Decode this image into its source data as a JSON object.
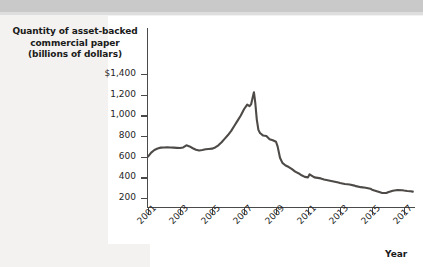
{
  "figure": {
    "y_axis_title_lines": [
      "Quantity of asset-backed",
      "commercial paper",
      "(billions of dollars)"
    ],
    "x_axis_title": "Year",
    "line_color": "#4d4a47",
    "background_color": "#f3f2f0",
    "canvas_color": "#ffffff",
    "axis_color": "#4a4a4a"
  },
  "chart_data": {
    "type": "line",
    "title": "",
    "xlabel": "Year",
    "ylabel": "Quantity of asset-backed commercial paper (billions of dollars)",
    "xlim": [
      2001,
      2017.6
    ],
    "ylim": [
      0,
      1400
    ],
    "grid": false,
    "legend": null,
    "ytick_labels": [
      "$1,400",
      "1,200",
      "1,000",
      "800",
      "600",
      "400",
      "200"
    ],
    "ytick_values": [
      1400,
      1200,
      1000,
      800,
      600,
      400,
      200
    ],
    "xtick_labels": [
      "2001",
      "2003",
      "2005",
      "2007",
      "2009",
      "2011",
      "2013",
      "2015",
      "2017"
    ],
    "xtick_values": [
      2001,
      2003,
      2005,
      2007,
      2009,
      2011,
      2013,
      2015,
      2017
    ],
    "series": [
      {
        "name": "Asset-backed commercial paper outstanding",
        "x": [
          2001.0,
          2001.2,
          2001.4,
          2001.6,
          2001.8,
          2002.0,
          2002.2,
          2002.4,
          2002.6,
          2002.8,
          2003.0,
          2003.2,
          2003.4,
          2003.6,
          2003.8,
          2004.0,
          2004.2,
          2004.4,
          2004.6,
          2004.8,
          2005.0,
          2005.2,
          2005.4,
          2005.6,
          2005.8,
          2006.0,
          2006.2,
          2006.4,
          2006.6,
          2006.8,
          2007.0,
          2007.2,
          2007.35,
          2007.45,
          2007.55,
          2007.62,
          2007.7,
          2007.8,
          2007.9,
          2008.0,
          2008.2,
          2008.4,
          2008.6,
          2008.8,
          2009.0,
          2009.1,
          2009.25,
          2009.4,
          2009.6,
          2009.8,
          2010.0,
          2010.2,
          2010.4,
          2010.6,
          2010.8,
          2011.0,
          2011.1,
          2011.25,
          2011.4,
          2011.6,
          2011.8,
          2012.0,
          2012.3,
          2012.6,
          2012.9,
          2013.0,
          2013.3,
          2013.6,
          2013.9,
          2014.0,
          2014.3,
          2014.6,
          2014.9,
          2015.0,
          2015.3,
          2015.6,
          2015.9,
          2016.0,
          2016.3,
          2016.6,
          2016.9,
          2017.0,
          2017.2,
          2017.4,
          2017.55
        ],
        "y": [
          600,
          640,
          665,
          680,
          688,
          690,
          692,
          690,
          688,
          686,
          684,
          690,
          710,
          700,
          682,
          668,
          660,
          665,
          672,
          675,
          678,
          690,
          710,
          740,
          775,
          810,
          850,
          900,
          950,
          1000,
          1060,
          1105,
          1090,
          1110,
          1180,
          1225,
          1130,
          960,
          860,
          830,
          805,
          800,
          770,
          760,
          745,
          700,
          590,
          540,
          515,
          500,
          480,
          455,
          440,
          420,
          405,
          400,
          430,
          415,
          400,
          395,
          390,
          380,
          370,
          360,
          350,
          345,
          335,
          330,
          320,
          315,
          305,
          300,
          290,
          280,
          265,
          250,
          248,
          255,
          270,
          278,
          275,
          272,
          268,
          265,
          262
        ]
      }
    ]
  }
}
